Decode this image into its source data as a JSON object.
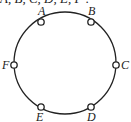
{
  "header": {
    "text": "A, B, C, D, E, F :"
  },
  "diagram": {
    "type": "ring",
    "circle": {
      "cx": 65,
      "cy": 63,
      "r": 51,
      "stroke": "#222222"
    },
    "nodes": [
      {
        "id": "A",
        "label": "A",
        "x": 41,
        "y": 22,
        "lx": 38,
        "ly": 15
      },
      {
        "id": "B",
        "label": "B",
        "x": 91,
        "y": 22,
        "lx": 88,
        "ly": 15
      },
      {
        "id": "C",
        "label": "C",
        "x": 116,
        "y": 65,
        "lx": 121,
        "ly": 69
      },
      {
        "id": "D",
        "label": "D",
        "x": 91,
        "y": 107,
        "lx": 87,
        "ly": 121
      },
      {
        "id": "E",
        "label": "E",
        "x": 41,
        "y": 107,
        "lx": 36,
        "ly": 121
      },
      {
        "id": "F",
        "label": "F",
        "x": 14,
        "y": 65,
        "lx": 2,
        "ly": 69
      }
    ]
  }
}
